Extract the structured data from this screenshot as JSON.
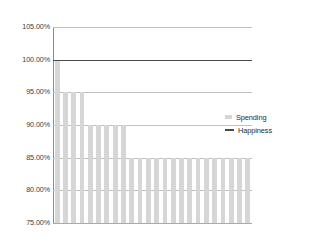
{
  "chart_data": {
    "type": "bar",
    "title": "",
    "subtitle": "",
    "xlabel": "",
    "ylabel": "",
    "ylim": [
      75,
      105
    ],
    "ytick_labels": [
      "105.00%",
      "100.00%",
      "95.00%",
      "90.00%",
      "85.00%",
      "80.00%",
      "75.00%"
    ],
    "ytick_values": [
      105,
      100,
      95,
      90,
      85,
      80,
      75
    ],
    "grid": true,
    "legend_position": "right",
    "categories": [
      "1",
      "2",
      "3",
      "4",
      "5",
      "6",
      "7",
      "8",
      "9",
      "10",
      "11",
      "12",
      "13",
      "14",
      "15",
      "16",
      "17",
      "18",
      "19",
      "20",
      "21",
      "22",
      "23",
      "24"
    ],
    "series": [
      {
        "name": "Spending",
        "type": "bar",
        "color": "#d6d6d6",
        "values": [
          100,
          95,
          95,
          95,
          90,
          90,
          90,
          90,
          90,
          85,
          85,
          85,
          85,
          85,
          85,
          85,
          85,
          85,
          85,
          85,
          85,
          85,
          85,
          85
        ]
      },
      {
        "name": "Happiness",
        "type": "line",
        "color": "#4a4a4a",
        "values": [
          100,
          100,
          100,
          100,
          100,
          100,
          100,
          100,
          100,
          100,
          100,
          100,
          100,
          100,
          100,
          100,
          100,
          100,
          100,
          100,
          100,
          100,
          100,
          100
        ]
      }
    ]
  },
  "legend": {
    "items": [
      {
        "label": "Spending",
        "marker": "bar-swatch-icon",
        "color": "#d6d6d6"
      },
      {
        "label": "Happiness",
        "marker": "line-swatch-icon",
        "color": "#4a4a4a"
      }
    ]
  },
  "colors": {
    "bar": "#d6d6d6",
    "line": "#4a4a4a",
    "grid": "#bfbfbf",
    "axis": "#8c8c8c",
    "text": "#3c3c3c",
    "background": "#ffffff"
  }
}
